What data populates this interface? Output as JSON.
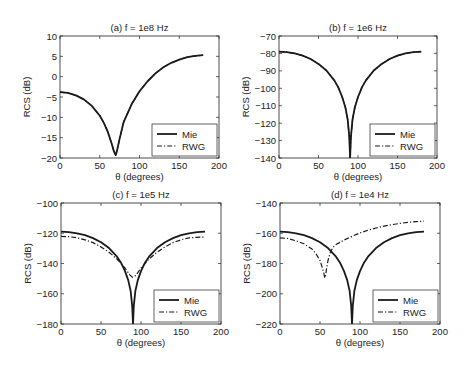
{
  "chart_data": [
    {
      "type": "line",
      "title": "(a) f = 1e8 Hz",
      "xlabel": "θ (degrees)",
      "ylabel": "RCS (dB)",
      "xlim": [
        0,
        200
      ],
      "ylim": [
        -20,
        10
      ],
      "xticks": [
        0,
        50,
        100,
        150,
        200
      ],
      "yticks": [
        -20,
        -15,
        -10,
        -5,
        0,
        5,
        10
      ],
      "grid": false,
      "legend_position": "lower right",
      "series": [
        {
          "name": "Mie",
          "style": "solid",
          "x": [
            0,
            10,
            20,
            30,
            40,
            50,
            55,
            60,
            65,
            68,
            70,
            72,
            75,
            80,
            90,
            100,
            110,
            120,
            130,
            140,
            150,
            160,
            170,
            180
          ],
          "y": [
            -3.8,
            -4.0,
            -4.6,
            -5.6,
            -7.2,
            -9.6,
            -11.3,
            -13.5,
            -16.5,
            -18.5,
            -19.3,
            -18.0,
            -15.3,
            -11.2,
            -6.8,
            -3.6,
            -1.2,
            0.8,
            2.3,
            3.4,
            4.2,
            4.8,
            5.1,
            5.3
          ]
        },
        {
          "name": "RWG",
          "style": "dashdot",
          "x": [
            0,
            10,
            20,
            30,
            40,
            50,
            55,
            60,
            65,
            68,
            70,
            72,
            75,
            80,
            90,
            100,
            110,
            120,
            130,
            140,
            150,
            160,
            170,
            180
          ],
          "y": [
            -3.8,
            -4.0,
            -4.6,
            -5.6,
            -7.2,
            -9.6,
            -11.3,
            -13.5,
            -16.5,
            -18.5,
            -19.3,
            -18.0,
            -15.3,
            -11.2,
            -6.8,
            -3.6,
            -1.2,
            0.8,
            2.3,
            3.4,
            4.2,
            4.8,
            5.1,
            5.3
          ]
        }
      ]
    },
    {
      "type": "line",
      "title": "(b) f = 1e6 Hz",
      "xlabel": "θ (degrees)",
      "ylabel": "RCS (dB)",
      "xlim": [
        0,
        200
      ],
      "ylim": [
        -140,
        -70
      ],
      "xticks": [
        0,
        50,
        100,
        150,
        200
      ],
      "yticks": [
        -140,
        -130,
        -120,
        -110,
        -100,
        -90,
        -80,
        -70
      ],
      "grid": false,
      "legend_position": "lower right",
      "series": [
        {
          "name": "Mie",
          "style": "solid",
          "x": [
            0,
            10,
            20,
            30,
            40,
            50,
            60,
            70,
            75,
            80,
            84,
            87,
            89,
            90,
            91,
            93,
            96,
            100,
            105,
            110,
            120,
            130,
            140,
            150,
            160,
            170,
            180
          ],
          "y": [
            -79,
            -79.3,
            -80,
            -81.3,
            -83.2,
            -86,
            -89.8,
            -95.5,
            -99.5,
            -105,
            -111,
            -118,
            -128,
            -140,
            -128,
            -118,
            -111,
            -105,
            -99.5,
            -95.5,
            -89.8,
            -86,
            -83.2,
            -81.3,
            -80,
            -79.3,
            -79
          ]
        },
        {
          "name": "RWG",
          "style": "dashdot",
          "x": [
            0,
            10,
            20,
            30,
            40,
            50,
            60,
            70,
            75,
            80,
            84,
            87,
            89,
            90,
            91,
            93,
            96,
            100,
            105,
            110,
            120,
            130,
            140,
            150,
            160,
            170,
            180
          ],
          "y": [
            -79,
            -79.3,
            -80,
            -81.3,
            -83.2,
            -86,
            -89.8,
            -95.5,
            -99.5,
            -105,
            -111,
            -118,
            -128,
            -140,
            -128,
            -118,
            -111,
            -105,
            -99.5,
            -95.5,
            -89.8,
            -86,
            -83.2,
            -81.3,
            -80,
            -79.3,
            -79
          ]
        }
      ]
    },
    {
      "type": "line",
      "title": "(c) f = 1e5 Hz",
      "xlabel": "θ (degrees)",
      "ylabel": "RCS (dB)",
      "xlim": [
        0,
        200
      ],
      "ylim": [
        -180,
        -100
      ],
      "xticks": [
        0,
        50,
        100,
        150,
        200
      ],
      "yticks": [
        -180,
        -160,
        -140,
        -120,
        -100
      ],
      "grid": false,
      "legend_position": "lower right",
      "series": [
        {
          "name": "Mie",
          "style": "solid",
          "x": [
            0,
            10,
            20,
            30,
            40,
            50,
            60,
            70,
            75,
            80,
            84,
            87,
            89,
            90,
            91,
            93,
            96,
            100,
            105,
            110,
            120,
            130,
            140,
            150,
            160,
            170,
            180
          ],
          "y": [
            -119,
            -119.3,
            -120,
            -121.3,
            -123.2,
            -126,
            -129.8,
            -135.5,
            -139.5,
            -145,
            -151,
            -158,
            -168,
            -180,
            -168,
            -158,
            -151,
            -145,
            -139.5,
            -135.5,
            -129.8,
            -126,
            -123.2,
            -121.3,
            -120,
            -119.3,
            -119
          ]
        },
        {
          "name": "RWG",
          "style": "dashdot",
          "x": [
            0,
            10,
            20,
            30,
            40,
            50,
            60,
            70,
            75,
            80,
            84,
            86,
            88,
            89,
            90,
            91,
            92,
            94,
            96,
            100,
            105,
            110,
            120,
            130,
            140,
            150,
            160,
            170,
            180
          ],
          "y": [
            -122,
            -122.3,
            -123,
            -124.3,
            -126.2,
            -129,
            -132.5,
            -137,
            -140,
            -143,
            -146,
            -147.5,
            -148.5,
            -149,
            -149,
            -149,
            -148.5,
            -147.5,
            -146,
            -143,
            -140,
            -137,
            -132.5,
            -129,
            -126.2,
            -124.3,
            -123,
            -122.7,
            -122.5
          ]
        }
      ]
    },
    {
      "type": "line",
      "title": "(d) f = 1e4 Hz",
      "xlabel": "θ (degrees)",
      "ylabel": "RCS (dB)",
      "xlim": [
        0,
        200
      ],
      "ylim": [
        -220,
        -140
      ],
      "xticks": [
        0,
        50,
        100,
        150,
        200
      ],
      "yticks": [
        -220,
        -200,
        -180,
        -160,
        -140
      ],
      "grid": false,
      "legend_position": "lower right",
      "series": [
        {
          "name": "Mie",
          "style": "solid",
          "x": [
            0,
            10,
            20,
            30,
            40,
            50,
            60,
            70,
            75,
            80,
            84,
            87,
            89,
            90,
            91,
            93,
            96,
            100,
            105,
            110,
            120,
            130,
            140,
            150,
            160,
            170,
            180
          ],
          "y": [
            -159,
            -159.3,
            -160,
            -161.3,
            -163.2,
            -166,
            -169.8,
            -175.5,
            -179.5,
            -185,
            -191,
            -198,
            -208,
            -220,
            -208,
            -198,
            -191,
            -185,
            -179.5,
            -175.5,
            -169.8,
            -166,
            -163.2,
            -161.3,
            -160,
            -159.3,
            -159
          ]
        },
        {
          "name": "RWG",
          "style": "dashdot",
          "x": [
            0,
            10,
            20,
            30,
            40,
            45,
            50,
            53,
            55,
            56,
            57,
            58,
            60,
            63,
            66,
            70,
            80,
            90,
            100,
            110,
            120,
            130,
            140,
            150,
            160,
            170,
            180
          ],
          "y": [
            -163,
            -163.5,
            -165,
            -167,
            -170.5,
            -173.5,
            -178,
            -183,
            -187,
            -189.5,
            -188,
            -184,
            -178,
            -172.5,
            -169.5,
            -167.5,
            -164.5,
            -162,
            -159.8,
            -158,
            -156.5,
            -155.3,
            -154.3,
            -153.5,
            -152.8,
            -152.3,
            -152
          ]
        }
      ]
    }
  ],
  "legend": {
    "items": [
      "Mie",
      "RWG"
    ]
  },
  "colors": {
    "line": "#1a1a1a",
    "axis": "#222222",
    "background": "#ffffff"
  }
}
